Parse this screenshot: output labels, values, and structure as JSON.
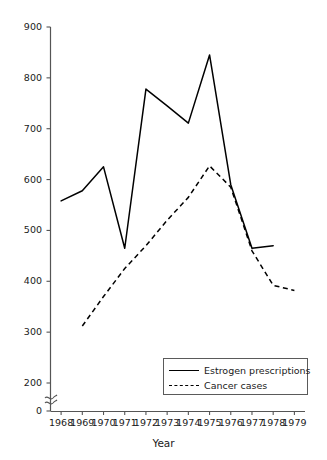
{
  "chart_data": {
    "type": "line",
    "title": "",
    "xlabel": "Year",
    "ylabel": "",
    "x": [
      1968,
      1969,
      1970,
      1971,
      1972,
      1973,
      1974,
      1975,
      1976,
      1977,
      1978,
      1979
    ],
    "xtick_labels": [
      "1968",
      "1969",
      "1970",
      "1971",
      "1972",
      "1973",
      "1974",
      "1975",
      "1976",
      "1977",
      "1978",
      "1979"
    ],
    "ytick_labels": [
      "0",
      "200",
      "300",
      "400",
      "500",
      "600",
      "700",
      "800",
      "900"
    ],
    "ytick_values": [
      0,
      200,
      300,
      400,
      500,
      600,
      700,
      800,
      900
    ],
    "ylim": [
      200,
      900
    ],
    "xlim": [
      1967.5,
      1979.5
    ],
    "axis_break": true,
    "axis_break_label": "y-axis break between 0 and 200",
    "grid": false,
    "legend_position": "lower right",
    "series": [
      {
        "name": "Estrogen prescriptions",
        "style": "solid",
        "color": "#000000",
        "x": [
          1968,
          1969,
          1970,
          1971,
          1972,
          1973,
          1974,
          1975,
          1976,
          1977,
          1978
        ],
        "values": [
          558,
          578,
          625,
          465,
          778,
          745,
          711,
          845,
          590,
          465,
          470
        ]
      },
      {
        "name": "Cancer cases",
        "style": "dashed",
        "color": "#000000",
        "x": [
          1969,
          1970,
          1971,
          1972,
          1973,
          1974,
          1975,
          1976,
          1977,
          1978,
          1979
        ],
        "values": [
          312,
          370,
          425,
          470,
          520,
          565,
          627,
          585,
          460,
          392,
          382
        ]
      }
    ]
  },
  "legend": {
    "items": [
      {
        "label": "Estrogen prescriptions",
        "style": "solid"
      },
      {
        "label": "Cancer cases",
        "style": "dashed"
      }
    ]
  },
  "axes": {
    "x_title": "Year"
  }
}
